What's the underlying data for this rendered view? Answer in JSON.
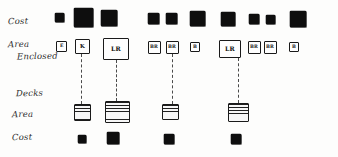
{
  "diagram": {
    "type": "hand-drawn-comparison-diagram",
    "colors": {
      "ink": "#1a1a1a",
      "fill_black": "#0d0d0d",
      "dash": "#4a4a4a",
      "paper": "#fdfdfc"
    },
    "row_labels": {
      "cost_top": "Cost",
      "area_enclosed_line1": "Area",
      "area_enclosed_line2": "Enclosed",
      "decks": "Decks",
      "area_bottom": "Area",
      "cost_bottom": "Cost"
    },
    "rows": {
      "cost_top": {
        "name": "Cost",
        "items": [
          {
            "label": "E",
            "size": 9,
            "x": 55,
            "y": 13
          },
          {
            "label": "K",
            "size": 19,
            "x": 74,
            "y": 8
          },
          {
            "label": "LR",
            "size": 16,
            "x": 101,
            "y": 10
          },
          {
            "label": "BR",
            "size": 11,
            "x": 148,
            "y": 13
          },
          {
            "label": "BR",
            "size": 11,
            "x": 166,
            "y": 13
          },
          {
            "label": "B",
            "size": 15,
            "x": 190,
            "y": 11
          },
          {
            "label": "LR",
            "size": 14,
            "x": 221,
            "y": 12
          },
          {
            "label": "BR",
            "size": 10,
            "x": 249,
            "y": 14
          },
          {
            "label": "BR",
            "size": 9,
            "x": 266,
            "y": 15
          },
          {
            "label": "B",
            "size": 16,
            "x": 290,
            "y": 11
          }
        ]
      },
      "area_enclosed": {
        "name": "Area Enclosed",
        "items": [
          {
            "label": "E",
            "w": 11,
            "h": 11,
            "x": 56,
            "y": 41,
            "size_class": "sz-small"
          },
          {
            "label": "K",
            "w": 15,
            "h": 15,
            "x": 75,
            "y": 39,
            "size_class": ""
          },
          {
            "label": "LR",
            "w": 26,
            "h": 22,
            "x": 103,
            "y": 38,
            "size_class": "sz-lr"
          },
          {
            "label": "BR",
            "w": 13,
            "h": 13,
            "x": 148,
            "y": 41,
            "size_class": "sz-small"
          },
          {
            "label": "BR",
            "w": 13,
            "h": 13,
            "x": 166,
            "y": 41,
            "size_class": "sz-small"
          },
          {
            "label": "B",
            "w": 10,
            "h": 10,
            "x": 190,
            "y": 42,
            "size_class": "sz-small"
          },
          {
            "label": "LR",
            "w": 22,
            "h": 18,
            "x": 219,
            "y": 40,
            "size_class": "sz-lr"
          },
          {
            "label": "BR",
            "w": 13,
            "h": 13,
            "x": 248,
            "y": 41,
            "size_class": "sz-small"
          },
          {
            "label": "BR",
            "w": 13,
            "h": 13,
            "x": 264,
            "y": 41,
            "size_class": "sz-small"
          },
          {
            "label": "B",
            "w": 10,
            "h": 10,
            "x": 289,
            "y": 42,
            "size_class": "sz-small"
          }
        ]
      },
      "decks_area": {
        "name": "Area",
        "items": [
          {
            "w": 17,
            "h": 17,
            "x": 74,
            "y": 104
          },
          {
            "w": 25,
            "h": 22,
            "x": 105,
            "y": 101
          },
          {
            "w": 17,
            "h": 16,
            "x": 162,
            "y": 104
          },
          {
            "w": 21,
            "h": 19,
            "x": 228,
            "y": 103
          }
        ]
      },
      "cost_bottom": {
        "name": "Cost",
        "items": [
          {
            "size": 8,
            "x": 78,
            "y": 135
          },
          {
            "size": 12,
            "x": 107,
            "y": 132
          },
          {
            "size": 10,
            "x": 164,
            "y": 134
          },
          {
            "size": 10,
            "x": 231,
            "y": 134
          }
        ]
      }
    },
    "connectors": [
      {
        "x": 81,
        "top": 54,
        "height": 50
      },
      {
        "x": 116,
        "top": 60,
        "height": 41
      },
      {
        "x": 172,
        "top": 54,
        "height": 50
      },
      {
        "x": 238,
        "top": 58,
        "height": 45
      }
    ]
  }
}
